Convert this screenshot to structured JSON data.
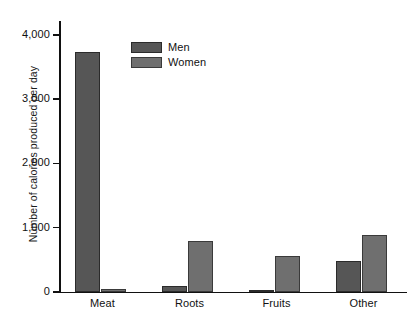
{
  "chart_data": {
    "type": "bar",
    "title": "",
    "subtitle": "",
    "xlabel": "",
    "ylabel": "Number of calories produced per day",
    "categories": [
      "Meat",
      "Roots",
      "Fruits",
      "Other"
    ],
    "series": [
      {
        "name": "Men",
        "color": "#565656",
        "values": [
          3730,
          100,
          30,
          480
        ]
      },
      {
        "name": "Women",
        "color": "#6f6f6f",
        "values": [
          50,
          800,
          560,
          890
        ]
      }
    ],
    "ylim": [
      0,
      4200
    ],
    "y_ticks": [
      0,
      1000,
      2000,
      3000,
      4000
    ],
    "y_tick_labels": [
      "0",
      "1,000",
      "2,000",
      "3,000",
      "4,000"
    ],
    "grid": false,
    "legend_position": "top-center-left",
    "legend_entries": [
      "Men",
      "Women"
    ]
  }
}
